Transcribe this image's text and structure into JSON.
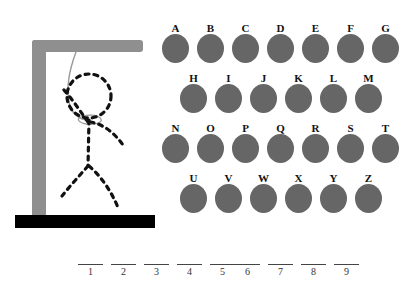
{
  "game": {
    "title": "Hangman",
    "background_color": "#ffffff"
  },
  "gallows": {
    "name": "gallows",
    "post_color": "#8f8f8f",
    "beam_color": "#8f8f8f",
    "base_color": "#000000",
    "rope_color": "#999999"
  },
  "figure": {
    "name": "hangman-figure",
    "state": "outline",
    "stroke_color": "#111111",
    "parts": [
      "head",
      "torso",
      "left-arm",
      "right-arm",
      "left-leg",
      "right-leg"
    ]
  },
  "alphabet": {
    "disc_color": "#666666",
    "label_color": "#111111",
    "rows": [
      {
        "letters": [
          "A",
          "B",
          "C",
          "D",
          "E",
          "F",
          "G"
        ]
      },
      {
        "letters": [
          "H",
          "I",
          "J",
          "K",
          "L",
          "M"
        ]
      },
      {
        "letters": [
          "N",
          "O",
          "P",
          "Q",
          "R",
          "S",
          "T"
        ]
      },
      {
        "letters": [
          "U",
          "V",
          "W",
          "X",
          "Y",
          "Z"
        ]
      }
    ]
  },
  "answer": {
    "groups": [
      {
        "numbers": [
          "1",
          "2",
          "3",
          "4",
          "5"
        ]
      },
      {
        "numbers": [
          "6",
          "7",
          "8",
          "9"
        ]
      }
    ]
  }
}
